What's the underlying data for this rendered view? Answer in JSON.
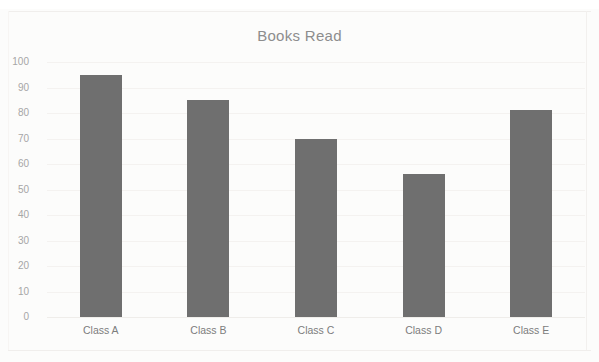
{
  "chart_data": {
    "type": "bar",
    "title": "Books Read",
    "xlabel": "",
    "ylabel": "",
    "categories": [
      "Class A",
      "Class B",
      "Class C",
      "Class D",
      "Class E"
    ],
    "values": [
      95,
      85,
      70,
      56,
      81
    ],
    "ylim": [
      0,
      100
    ],
    "ytick_labels": [
      "100",
      "90",
      "80",
      "70",
      "60",
      "50",
      "40",
      "30",
      "20",
      "10",
      "0"
    ],
    "ytick_values": [
      100,
      90,
      80,
      70,
      60,
      50,
      40,
      30,
      20,
      10,
      0
    ],
    "grid": true,
    "legend": false,
    "legend_position": "none",
    "series": [
      {
        "name": "Books Read",
        "values": [
          95,
          85,
          70,
          56,
          81
        ]
      }
    ],
    "colors": {
      "bar_fill": "#6f6f6f",
      "title_text": "#8d8d8d",
      "tick_text": "#a6a6a6",
      "category_text": "#7d7d7d",
      "gridline": "#f4f2f0",
      "background": "#fcfcfb"
    }
  }
}
